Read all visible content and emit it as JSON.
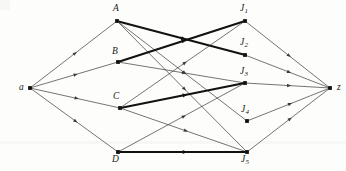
{
  "figure": {
    "kind": "flow-network-diagram",
    "title": "",
    "width": 346,
    "height": 171,
    "background_color": "#fdfdfb",
    "edge_color": "#3a3a3a",
    "bold_edge_color": "#111111",
    "node_color": "#111111"
  },
  "nodes": [
    {
      "id": "a",
      "label": "a",
      "sub": "",
      "x": 30,
      "y": 88,
      "label_x": 19,
      "label_y": 83,
      "role": "source"
    },
    {
      "id": "A",
      "label": "A",
      "sub": "",
      "x": 117,
      "y": 21,
      "label_x": 113,
      "label_y": 4,
      "role": "left"
    },
    {
      "id": "B",
      "label": "B",
      "sub": "",
      "x": 118,
      "y": 62,
      "label_x": 112,
      "label_y": 47,
      "role": "left"
    },
    {
      "id": "C",
      "label": "C",
      "sub": "",
      "x": 120,
      "y": 108,
      "label_x": 113,
      "label_y": 92,
      "role": "left"
    },
    {
      "id": "D",
      "label": "D",
      "sub": "",
      "x": 118,
      "y": 152,
      "label_x": 112,
      "label_y": 155,
      "role": "left"
    },
    {
      "id": "J1",
      "label": "J",
      "sub": "1",
      "x": 245,
      "y": 21,
      "label_x": 240,
      "label_y": 4,
      "role": "right"
    },
    {
      "id": "J2",
      "label": "J",
      "sub": "2",
      "x": 245,
      "y": 55,
      "label_x": 240,
      "label_y": 38,
      "role": "right"
    },
    {
      "id": "J3",
      "label": "J",
      "sub": "3",
      "x": 245,
      "y": 83,
      "label_x": 240,
      "label_y": 67,
      "role": "right"
    },
    {
      "id": "J4",
      "label": "J",
      "sub": "4",
      "x": 247,
      "y": 121,
      "label_x": 241,
      "label_y": 105,
      "role": "right"
    },
    {
      "id": "J5",
      "label": "J",
      "sub": "5",
      "x": 247,
      "y": 152,
      "label_x": 241,
      "label_y": 155,
      "role": "right"
    },
    {
      "id": "z",
      "label": "z",
      "sub": "",
      "x": 330,
      "y": 88,
      "label_x": 337,
      "label_y": 83,
      "role": "sink"
    }
  ],
  "edges": [
    {
      "from": "a",
      "to": "A",
      "bold": false
    },
    {
      "from": "a",
      "to": "B",
      "bold": false
    },
    {
      "from": "a",
      "to": "C",
      "bold": false
    },
    {
      "from": "a",
      "to": "D",
      "bold": false
    },
    {
      "from": "A",
      "to": "J2",
      "bold": true
    },
    {
      "from": "A",
      "to": "J4",
      "bold": false
    },
    {
      "from": "A",
      "to": "J5",
      "bold": false
    },
    {
      "from": "B",
      "to": "J1",
      "bold": true
    },
    {
      "from": "B",
      "to": "J3",
      "bold": false
    },
    {
      "from": "C",
      "to": "J3",
      "bold": true
    },
    {
      "from": "C",
      "to": "J1",
      "bold": false
    },
    {
      "from": "C",
      "to": "J5",
      "bold": false
    },
    {
      "from": "D",
      "to": "J5",
      "bold": true
    },
    {
      "from": "D",
      "to": "J3",
      "bold": false
    },
    {
      "from": "J1",
      "to": "z",
      "bold": false
    },
    {
      "from": "J2",
      "to": "z",
      "bold": false
    },
    {
      "from": "J3",
      "to": "z",
      "bold": false
    },
    {
      "from": "J4",
      "to": "z",
      "bold": false
    },
    {
      "from": "J5",
      "to": "z",
      "bold": false
    }
  ]
}
